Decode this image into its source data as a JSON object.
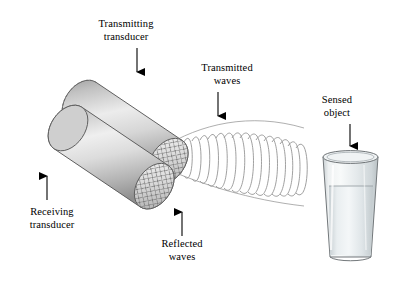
{
  "figure": {
    "type": "technical-illustration",
    "background_color": "#ffffff",
    "ink_color": "#000000"
  },
  "labels": {
    "transmitting_transducer": "Transmitting\ntransducer",
    "receiving_transducer": "Receiving\ntransducer",
    "transmitted_waves": "Transmitted\nwaves",
    "reflected_waves": "Reflected\nwaves",
    "sensed_object": "Sensed\nobject"
  },
  "parts": {
    "transducer_front": {
      "name": "transducer-cylinder-front",
      "fill": "#d9d9d9",
      "edge": "#5a5a5a",
      "face_pattern": "cross-hatch-grid"
    },
    "transducer_back": {
      "name": "transducer-cylinder-back",
      "fill": "#cfcfcf",
      "edge": "#5a5a5a",
      "face_pattern": "cross-hatch-grid"
    },
    "glass": {
      "name": "drinking-glass",
      "fill": "#e8ecee",
      "liquid_fill": "#dde3e6",
      "edge": "#6e7376"
    },
    "wave_cone": {
      "name": "ultrasonic-wave-cone",
      "arc_count": 18,
      "stroke": "#8a8a8a"
    }
  },
  "arrows": {
    "transmitting": {
      "name": "arrow-to-transmitting-transducer",
      "direction": "down"
    },
    "transmitted": {
      "name": "arrow-to-transmitted-waves",
      "direction": "down"
    },
    "sensed": {
      "name": "arrow-to-sensed-object",
      "direction": "down"
    },
    "receiving": {
      "name": "arrow-to-receiving-transducer",
      "direction": "up"
    },
    "reflected": {
      "name": "arrow-to-reflected-waves",
      "direction": "up"
    }
  }
}
